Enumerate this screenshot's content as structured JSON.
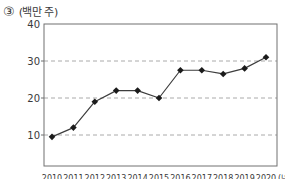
{
  "figure": {
    "number_label": "③",
    "y_unit_label": "(백만 주)",
    "x_unit_label": "(년)"
  },
  "colors": {
    "background": "#ffffff",
    "frame": "#707070",
    "grid": "#a0a0a0",
    "line": "#3d3d3d",
    "marker": "#1b1b1b",
    "text": "#3a3a3a"
  },
  "chart_data": {
    "type": "line",
    "title": "",
    "ylabel": "(백만 주)",
    "xlabel": "(년)",
    "categories": [
      "2010",
      "2011",
      "2012",
      "2013",
      "2014",
      "2015",
      "2016",
      "2017",
      "2018",
      "2019",
      "2020"
    ],
    "values": [
      9.5,
      12,
      19,
      22,
      22,
      20,
      27.5,
      27.5,
      26.5,
      28,
      31
    ],
    "ylim": [
      0,
      40
    ],
    "yticks": [
      10,
      20,
      30,
      40
    ],
    "grid": "horizontal-dashed-at-10-20-30",
    "legend": "none",
    "marker_shape": "diamond",
    "x_labels_clipped_at_bottom": true
  }
}
